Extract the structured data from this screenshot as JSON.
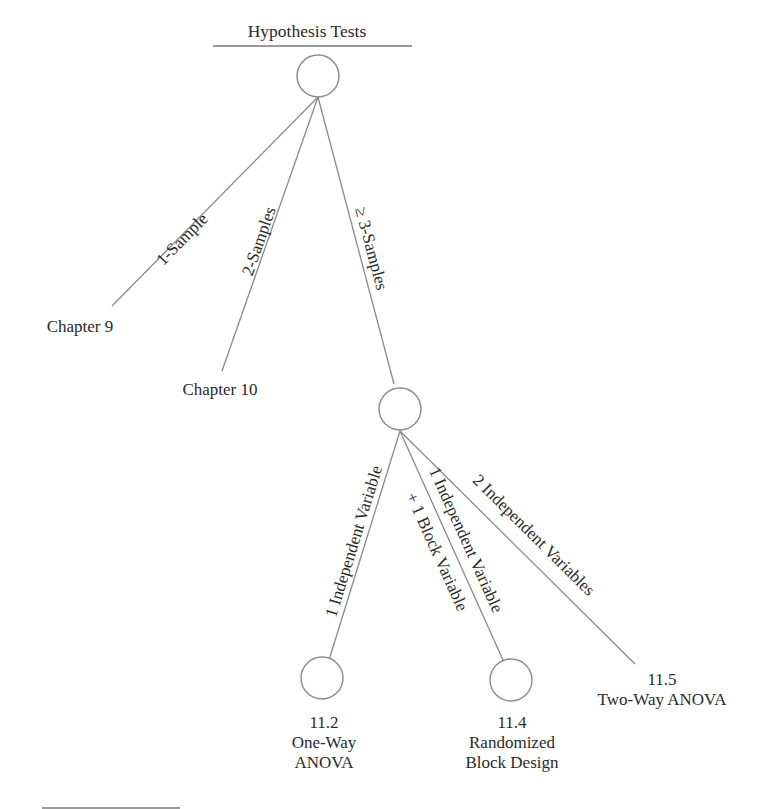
{
  "title": "Hypothesis Tests",
  "root": {
    "id": "hypothesis-tests"
  },
  "edges": {
    "one_sample": "1-Sample",
    "two_samples": "2-Samples",
    "three_samples": "≥ 3-Samples",
    "one_indep": "1 Independent Variable",
    "one_indep_block_line1": "1 Independent Variable",
    "one_indep_block_line2": "+ 1 Block Variable",
    "two_indep": "2 Independent Variables"
  },
  "leaves": {
    "chapter9": {
      "label": "Chapter 9"
    },
    "chapter10": {
      "label": "Chapter 10"
    },
    "oneway": {
      "section": "11.2",
      "line1": "One-Way",
      "line2": "ANOVA"
    },
    "randomized": {
      "section": "11.4",
      "line1": "Randomized",
      "line2": "Block Design"
    },
    "twoway": {
      "section": "11.5",
      "line1": "Two-Way ANOVA"
    }
  },
  "colors": {
    "line": "#8a8a8a",
    "text": "#2a2a2a",
    "background": "#ffffff"
  }
}
